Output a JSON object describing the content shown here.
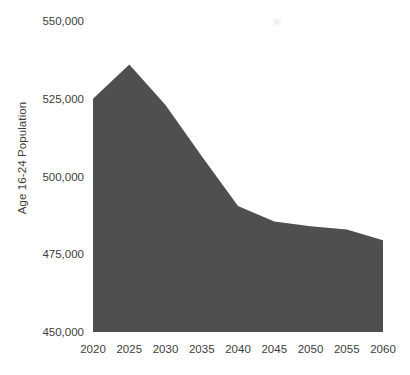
{
  "chart_data": {
    "type": "area",
    "title": "",
    "xlabel": "",
    "ylabel": "Age 16-24 Population",
    "x": [
      2020,
      2025,
      2030,
      2035,
      2040,
      2045,
      2050,
      2055,
      2060
    ],
    "values": [
      525000,
      536000,
      523000,
      506500,
      490500,
      485500,
      484000,
      483000,
      479500
    ],
    "series_name": "Age 16-24 Population",
    "xlim": [
      2020,
      2060
    ],
    "ylim": [
      450000,
      550000
    ],
    "xticks": [
      2020,
      2025,
      2030,
      2035,
      2040,
      2045,
      2050,
      2055,
      2060
    ],
    "xtick_labels": [
      "2020",
      "2025",
      "2030",
      "2035",
      "2040",
      "2045",
      "2050",
      "2055",
      "2060"
    ],
    "yticks": [
      450000,
      475000,
      500000,
      525000,
      550000
    ],
    "ytick_labels": [
      "450,000",
      "475,000",
      "500,000",
      "525,000",
      "550,000"
    ],
    "grid": false,
    "legend": false,
    "axis_lines": false
  },
  "style": {
    "area_fill_color": "#4e4f51",
    "text_color": "#3d3d3d",
    "background_color": "#ffffff"
  },
  "pixel_frame": {
    "x_left": 93,
    "x_right": 383,
    "y_top_value_px": 21,
    "y_bottom_value_px": 332
  }
}
